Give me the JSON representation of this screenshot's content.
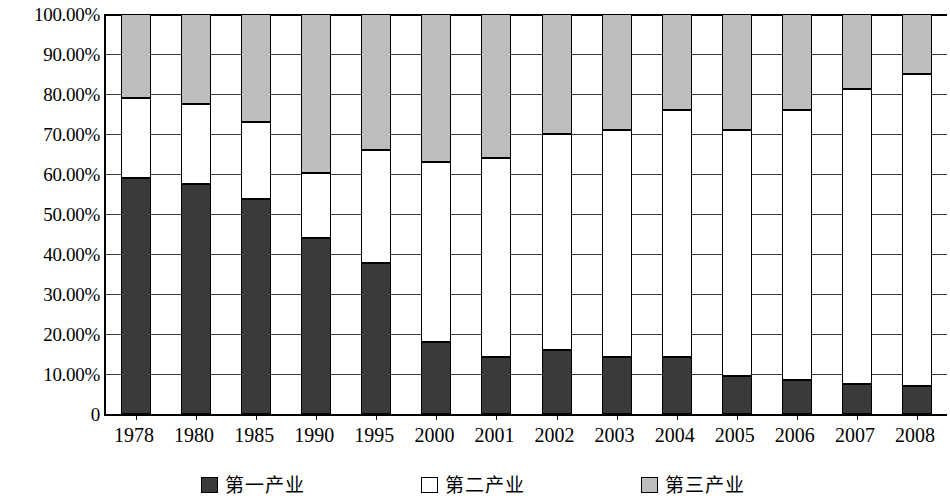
{
  "chart_data": {
    "type": "bar",
    "subtype": "stacked-percent",
    "title": "",
    "xlabel": "",
    "ylabel": "",
    "ylim": [
      0,
      100
    ],
    "grid": true,
    "legend_position": "bottom",
    "categories": [
      "1978",
      "1980",
      "1985",
      "1990",
      "1995",
      "2000",
      "2001",
      "2002",
      "2003",
      "2004",
      "2005",
      "2006",
      "2007",
      "2008"
    ],
    "ytick_labels": [
      "100.00%",
      "90.00%",
      "80.00%",
      "70.00%",
      "60.00%",
      "50.00%",
      "40.00%",
      "30.00%",
      "20.00%",
      "10.00%",
      "0"
    ],
    "ytick_values": [
      100,
      90,
      80,
      70,
      60,
      50,
      40,
      30,
      20,
      10,
      0
    ],
    "series": [
      {
        "name": "第一产业",
        "color": "#3a3a3a",
        "values": [
          59.0,
          57.5,
          53.8,
          43.9,
          37.8,
          18.0,
          14.3,
          16.1,
          14.2,
          14.3,
          9.6,
          8.4,
          7.5,
          7.0
        ]
      },
      {
        "name": "第二产业",
        "color": "#ffffff",
        "values": [
          20.0,
          20.0,
          19.2,
          16.3,
          28.2,
          45.0,
          49.7,
          53.9,
          56.8,
          61.7,
          61.4,
          67.6,
          73.8,
          78.0
        ]
      },
      {
        "name": "第三产业",
        "color": "#bdbdbd",
        "values": [
          21.0,
          22.5,
          27.0,
          39.8,
          34.0,
          37.0,
          36.0,
          30.0,
          29.0,
          24.0,
          29.0,
          24.0,
          18.7,
          15.0
        ]
      }
    ],
    "stack_boundaries": {
      "note": "cumulative top of first segment, and top of second segment, in percent",
      "first_top": [
        59.0,
        57.5,
        53.8,
        43.9,
        37.8,
        18.0,
        14.3,
        16.1,
        14.2,
        14.3,
        9.6,
        8.4,
        7.5,
        7.0
      ],
      "second_top": [
        79.0,
        77.5,
        73.0,
        60.2,
        66.0,
        63.0,
        64.0,
        70.0,
        71.0,
        76.0,
        71.0,
        76.0,
        81.3,
        85.0
      ]
    }
  },
  "legend": {
    "items": [
      {
        "label": "第一产业",
        "swatch": "s1"
      },
      {
        "label": "第二产业",
        "swatch": "s2"
      },
      {
        "label": "第三产业",
        "swatch": "s3"
      }
    ]
  }
}
